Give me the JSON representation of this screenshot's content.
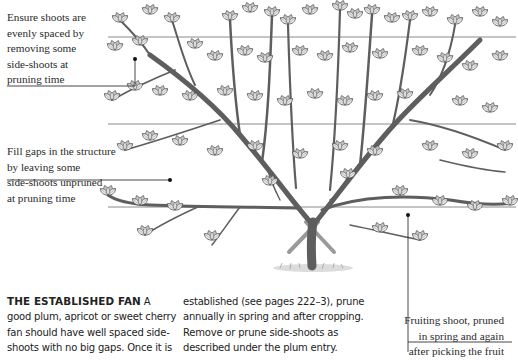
{
  "illustration": {
    "subject": "established fan-trained fruit tree on horizontal support wires",
    "wire_count": 3,
    "colors": {
      "ink": "#3a3a3a",
      "wire": "#8a8a8a",
      "leader": "#333333",
      "leaf_fill": "#e9e9e9",
      "trunk": "#6b6b6b"
    }
  },
  "callouts": [
    {
      "id": "even-spacing",
      "lines": [
        "Ensure shoots are",
        "evenly spaced by",
        "removing some",
        "side-shoots at",
        "pruning time"
      ]
    },
    {
      "id": "fill-gaps",
      "lines": [
        "Fill gaps in the structure",
        "by leaving some",
        "side-shoots unpruned",
        "at pruning time"
      ]
    },
    {
      "id": "fruiting-shoot",
      "lines": [
        "Fruiting shoot, pruned",
        "in spring and again",
        "after picking the fruit"
      ]
    }
  ],
  "body_text": {
    "heading": "THE ESTABLISHED FAN",
    "column_1": [
      "A",
      "good plum, apricot or sweet cherry",
      "fan should have well spaced side-",
      "shoots with no big gaps. Once it is"
    ],
    "column_2": [
      "established (see pages 222–3), prune",
      "annually in spring and after cropping.",
      "Remove or prune side-shoots as",
      "described under the plum entry."
    ]
  }
}
